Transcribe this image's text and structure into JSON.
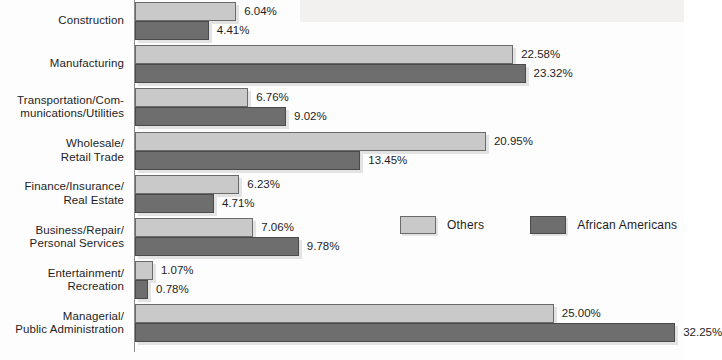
{
  "chart_data": {
    "type": "bar",
    "orientation": "horizontal",
    "title": "",
    "subtitle": "",
    "xlabel": "",
    "ylabel": "",
    "grid": false,
    "xlim": [
      0,
      32.25
    ],
    "value_suffix": "%",
    "legend_position": "middle-right",
    "categories": [
      "Construction",
      "Manufacturing",
      "Transportation/Com-\nmunications/Utilities",
      "Wholesale/\nRetail Trade",
      "Finance/Insurance/\nReal Estate",
      "Business/Repair/\nPersonal Services",
      "Entertainment/\nRecreation",
      "Managerial/\nPublic Administration"
    ],
    "series": [
      {
        "name": "Others",
        "color": "#c9c9c9",
        "values": [
          6.04,
          22.58,
          6.76,
          20.95,
          6.23,
          7.06,
          1.07,
          25.0
        ],
        "labels": [
          "6.04%",
          "22.58%",
          "6.76%",
          "20.95%",
          "6.23%",
          "7.06%",
          "1.07%",
          "25.00%"
        ]
      },
      {
        "name": "African Americans",
        "color": "#6e6e6e",
        "values": [
          4.41,
          23.32,
          9.02,
          13.45,
          4.71,
          9.78,
          0.78,
          32.25
        ],
        "labels": [
          "4.41%",
          "23.32%",
          "9.02%",
          "13.45%",
          "4.71%",
          "9.78%",
          "0.78%",
          "32.25%"
        ]
      }
    ]
  },
  "legend": {
    "items": [
      {
        "label": "Others",
        "color": "#c9c9c9"
      },
      {
        "label": "African Americans",
        "color": "#6e6e6e"
      }
    ]
  }
}
